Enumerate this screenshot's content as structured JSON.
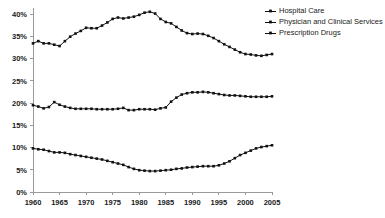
{
  "chart_data": {
    "type": "line",
    "title": "",
    "subtitle": "",
    "xlabel": "",
    "ylabel": "",
    "xlim": [
      1960,
      2005
    ],
    "ylim": [
      0,
      40
    ],
    "grid": false,
    "legend_position": "top-right",
    "y_tick_labels": [
      "0%",
      "5%",
      "10%",
      "15%",
      "20%",
      "25%",
      "30%",
      "35%",
      "40%"
    ],
    "y_tick_values": [
      0,
      5,
      10,
      15,
      20,
      25,
      30,
      35,
      40
    ],
    "x_tick_labels": [
      "1960",
      "1965",
      "1970",
      "1975",
      "1980",
      "1985",
      "1990",
      "1995",
      "2000",
      "2005"
    ],
    "x_tick_values": [
      1960,
      1965,
      1970,
      1975,
      1980,
      1985,
      1990,
      1995,
      2000,
      2005
    ],
    "x": [
      1960,
      1961,
      1962,
      1963,
      1964,
      1965,
      1966,
      1967,
      1968,
      1969,
      1970,
      1971,
      1972,
      1973,
      1974,
      1975,
      1976,
      1977,
      1978,
      1979,
      1980,
      1981,
      1982,
      1983,
      1984,
      1985,
      1986,
      1987,
      1988,
      1989,
      1990,
      1991,
      1992,
      1993,
      1994,
      1995,
      1996,
      1997,
      1998,
      1999,
      2000,
      2001,
      2002,
      2003,
      2004,
      2005
    ],
    "series": [
      {
        "name": "Hospital Care",
        "marker": "square",
        "color": "#111111",
        "values": [
          33.4,
          33.9,
          33.4,
          33.4,
          33.1,
          32.8,
          33.9,
          34.9,
          35.6,
          36.2,
          36.9,
          36.8,
          36.8,
          37.4,
          38.1,
          38.9,
          39.2,
          39.0,
          39.2,
          39.4,
          39.8,
          40.3,
          40.5,
          40.1,
          38.9,
          38.2,
          37.9,
          37.1,
          36.3,
          35.7,
          35.5,
          35.6,
          35.5,
          35.1,
          34.6,
          33.9,
          33.2,
          32.6,
          32.0,
          31.4,
          31.0,
          30.9,
          30.7,
          30.6,
          30.8,
          31.0
        ]
      },
      {
        "name": "Physician and Clinical Services",
        "marker": "square",
        "color": "#111111",
        "values": [
          19.5,
          19.2,
          18.8,
          19.1,
          20.2,
          19.6,
          19.2,
          18.9,
          18.7,
          18.7,
          18.7,
          18.7,
          18.6,
          18.6,
          18.6,
          18.6,
          18.7,
          18.9,
          18.4,
          18.4,
          18.6,
          18.6,
          18.6,
          18.5,
          18.8,
          19.0,
          20.3,
          21.2,
          21.9,
          22.2,
          22.4,
          22.4,
          22.5,
          22.4,
          22.2,
          22.0,
          21.8,
          21.7,
          21.7,
          21.6,
          21.5,
          21.4,
          21.4,
          21.4,
          21.4,
          21.5
        ]
      },
      {
        "name": "Prescription Drugs",
        "marker": "square",
        "color": "#111111",
        "values": [
          9.8,
          9.6,
          9.5,
          9.2,
          8.9,
          8.9,
          8.8,
          8.5,
          8.3,
          8.1,
          7.9,
          7.7,
          7.5,
          7.3,
          7.0,
          6.7,
          6.4,
          6.1,
          5.6,
          5.2,
          4.9,
          4.8,
          4.7,
          4.7,
          4.8,
          4.9,
          5.0,
          5.2,
          5.3,
          5.5,
          5.6,
          5.7,
          5.8,
          5.8,
          5.8,
          6.0,
          6.4,
          6.9,
          7.6,
          8.3,
          8.8,
          9.3,
          9.8,
          10.1,
          10.3,
          10.5
        ]
      }
    ]
  },
  "legend": {
    "items": [
      {
        "label": "Hospital Care"
      },
      {
        "label": "Physician and Clinical Services"
      },
      {
        "label": "Prescription Drugs"
      }
    ]
  },
  "layout": {
    "plot_left": 33,
    "plot_right": 272,
    "plot_top": 14,
    "plot_bottom": 192,
    "legend_x": 265,
    "legend_y": 11,
    "legend_row_height": 11,
    "legend_line_length": 11,
    "axis_color": "#9a9a9a"
  }
}
